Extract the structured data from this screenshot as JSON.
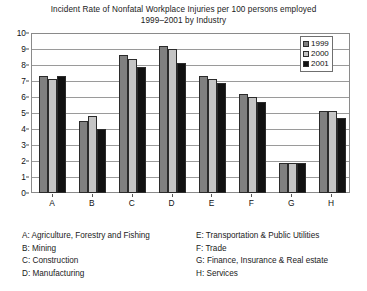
{
  "chart": {
    "title_line1": "Incident Rate of Nonfatal Workplace Injuries per 100 persons employed",
    "title_line2": "1999–2001 by Industry"
  },
  "chart_data": {
    "type": "bar",
    "title": "Incident Rate of Nonfatal Workplace Injuries per 100 persons employed 1999–2001 by Industry",
    "xlabel": "",
    "ylabel": "",
    "ylim": [
      0,
      10
    ],
    "yticks": [
      0,
      1,
      2,
      3,
      4,
      5,
      6,
      7,
      8,
      9,
      10
    ],
    "ytick_labels": [
      "0",
      "1",
      "2",
      "3",
      "4",
      "5",
      "6",
      "7",
      "8",
      "9",
      "10"
    ],
    "grid": true,
    "legend_position": "top-right",
    "categories": [
      "A",
      "B",
      "C",
      "D",
      "E",
      "F",
      "G",
      "H"
    ],
    "series": [
      {
        "name": "1999",
        "color": "#808080",
        "values": [
          7.3,
          4.5,
          8.6,
          9.2,
          7.3,
          6.2,
          1.9,
          5.1
        ]
      },
      {
        "name": "2000",
        "color": "#c4c4c4",
        "values": [
          7.1,
          4.8,
          8.4,
          9.0,
          7.1,
          6.0,
          1.9,
          5.1
        ]
      },
      {
        "name": "2001",
        "color": "#111111",
        "values": [
          7.3,
          4.0,
          7.9,
          8.1,
          6.9,
          5.7,
          1.9,
          4.7
        ]
      }
    ],
    "category_key": [
      "A: Agriculture, Forestry and Fishing",
      "B: Mining",
      "C: Construction",
      "D: Manufacturing",
      "E: Transportation & Public Utilities",
      "F: Trade",
      "G: Finance, Insurance & Real estate",
      "H: Services"
    ]
  }
}
